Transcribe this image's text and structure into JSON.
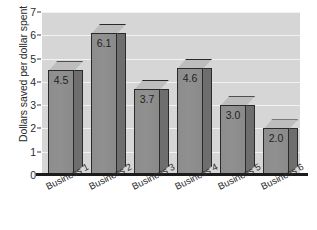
{
  "chart_data": {
    "type": "bar",
    "title": "",
    "subtitle": "",
    "xlabel": "",
    "ylabel": "Dollars saved per dollar spent",
    "categories": [
      "Business 1",
      "Business 2",
      "Business 3",
      "Business 4",
      "Business 5",
      "Business 6"
    ],
    "values": [
      4.5,
      6.1,
      3.7,
      4.6,
      3.0,
      2.0
    ],
    "value_labels": [
      "4.5",
      "6.1",
      "3.7",
      "4.6",
      "3.0",
      "2.0"
    ],
    "ylim": [
      0,
      7
    ],
    "ytick_labels": [
      "0",
      "1",
      "2",
      "3",
      "4",
      "5",
      "6",
      "7"
    ],
    "ytick_values": [
      0,
      1,
      2,
      3,
      4,
      5,
      6,
      7
    ],
    "grid": true,
    "grid_axis": "y",
    "grid_color": "#f2f2f2",
    "legend": false,
    "legend_position": "none",
    "plot_background": "#d6d6d6",
    "figure_background": "#ffffff",
    "bar_face_color": "#8d8d8d",
    "bar_side_color": "#6e6e6e",
    "bar_top_color": "#bdbdbd",
    "bar_edge_color": "#2a2a2a",
    "axis_color": "#1b1b1b",
    "style": "3d-bar"
  }
}
